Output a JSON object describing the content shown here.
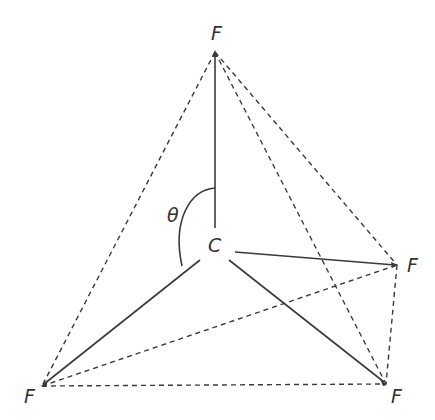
{
  "diagram": {
    "center": {
      "label": "C",
      "x": 215,
      "y": 245
    },
    "vertices": [
      {
        "id": "top",
        "label": "F",
        "x": 215,
        "y": 52,
        "label_x": 211,
        "label_y": 40
      },
      {
        "id": "right",
        "label": "F",
        "x": 397,
        "y": 265,
        "label_x": 407,
        "label_y": 272
      },
      {
        "id": "bottom_right",
        "label": "F",
        "x": 386,
        "y": 384,
        "label_x": 391,
        "label_y": 403
      },
      {
        "id": "bottom_left",
        "label": "F",
        "x": 42,
        "y": 386,
        "label_x": 24,
        "label_y": 403
      }
    ],
    "angle_label": "θ",
    "angle_label_pos": {
      "x": 167,
      "y": 222
    },
    "edge_style": {
      "bonds": "solid",
      "faces": "dashed"
    },
    "line_color": "#3a3a3a"
  }
}
